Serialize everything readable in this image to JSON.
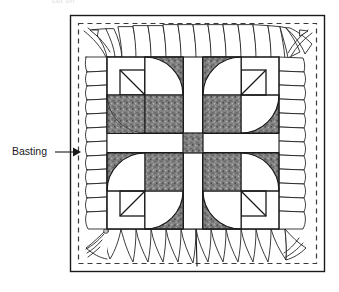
{
  "figure": {
    "title_fragment": "cut off",
    "callout": {
      "label": "Basting",
      "target": "basting-stitch-line"
    },
    "colors": {
      "ink": "#1a1a1a",
      "paper": "#ffffff",
      "patch_fill": "#808080",
      "patch_speckle_light": "#b8b8b8",
      "patch_speckle_dark": "#4a4a4a",
      "basting_dash": "#4a4a4a",
      "faint_text": "#d8d8d8"
    },
    "frame": {
      "outer_x": 70,
      "outer_y": 15,
      "outer_w": 255,
      "outer_h": 257,
      "basting_inset": 8,
      "basting_dash_pattern": "5 4"
    },
    "quilt_top": {
      "x": 107,
      "y": 57,
      "w": 172,
      "h": 172,
      "blocks": 4,
      "block_size": 76,
      "sashing_width": 20,
      "center_square_size": 20,
      "patch_description": "quarter-circle drunkard's path units in speckled gray",
      "unit_size": 38
    },
    "edges": {
      "description": "raw fabric / batting edges drawn as irregular gathered strips on all four sides",
      "strip_count_top": 11,
      "strip_count_bottom": 11,
      "strip_count_left": 11,
      "strip_count_right": 11
    }
  }
}
